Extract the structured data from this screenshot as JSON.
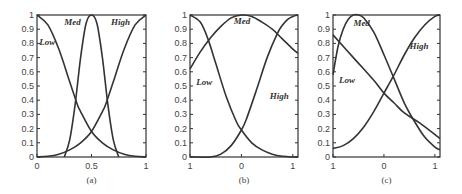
{
  "chart_data": [
    {
      "type": "line",
      "caption": "(a)",
      "xlim": [
        0,
        1
      ],
      "ylim": [
        0,
        1
      ],
      "xticks": [
        0,
        0.5,
        1
      ],
      "xtick_labels": [
        "0",
        "0.5",
        "1"
      ],
      "yticks": [
        0,
        0.1,
        0.2,
        0.3,
        0.4,
        0.5,
        0.6,
        0.7,
        0.8,
        0.9,
        1
      ],
      "ytick_labels": [
        "0",
        "0.1",
        "0.2",
        "0.3",
        "0.4",
        "0.5",
        "0.6",
        "0.7",
        "0.8",
        "0.9",
        "1"
      ],
      "series": [
        {
          "name": "Low",
          "label_pos": [
            0.02,
            0.79
          ],
          "x": [
            0,
            0.1,
            0.2,
            0.3,
            0.37,
            0.4,
            0.5,
            0.6,
            0.7,
            0.8,
            0.9,
            1
          ],
          "y": [
            1,
            0.93,
            0.76,
            0.53,
            0.37,
            0.32,
            0.18,
            0.1,
            0.05,
            0.02,
            0.005,
            0
          ]
        },
        {
          "name": "Med",
          "label_pos": [
            0.25,
            0.93
          ],
          "x": [
            0.25,
            0.3,
            0.35,
            0.4,
            0.45,
            0.5,
            0.55,
            0.6,
            0.65,
            0.7,
            0.75
          ],
          "y": [
            0,
            0.12,
            0.37,
            0.7,
            0.94,
            1,
            0.94,
            0.7,
            0.37,
            0.12,
            0
          ]
        },
        {
          "name": "High",
          "label_pos": [
            0.68,
            0.93
          ],
          "x": [
            0,
            0.1,
            0.2,
            0.3,
            0.4,
            0.5,
            0.6,
            0.63,
            0.7,
            0.8,
            0.9,
            1
          ],
          "y": [
            0,
            0.005,
            0.02,
            0.05,
            0.1,
            0.18,
            0.32,
            0.37,
            0.53,
            0.76,
            0.93,
            1
          ]
        }
      ]
    },
    {
      "type": "line",
      "caption": "(b)",
      "xlim": [
        -1,
        1.1
      ],
      "ylim": [
        0,
        1
      ],
      "xticks": [
        -1,
        0,
        1
      ],
      "xtick_labels": [
        "1",
        "0",
        "1"
      ],
      "yticks": [
        0,
        0.1,
        0.2,
        0.3,
        0.4,
        0.5,
        0.6,
        0.7,
        0.8,
        0.9,
        1
      ],
      "ytick_labels": [
        "0",
        "0.1",
        "0.2",
        "0.3",
        "0.4",
        "0.5",
        "0.6",
        "0.7",
        "0.8",
        "0.9",
        "1"
      ],
      "series": [
        {
          "name": "Low",
          "label_pos": [
            -0.88,
            0.51
          ],
          "x": [
            -1,
            -0.8,
            -0.65,
            -0.5,
            -0.3,
            -0.1,
            0,
            0.2,
            0.4,
            0.6,
            0.8,
            1,
            1.1
          ],
          "y": [
            1,
            0.95,
            0.83,
            0.66,
            0.43,
            0.25,
            0.19,
            0.1,
            0.05,
            0.02,
            0.005,
            0,
            0
          ]
        },
        {
          "name": "Med",
          "label_pos": [
            -0.15,
            0.94
          ],
          "x": [
            -1,
            -0.8,
            -0.6,
            -0.4,
            -0.2,
            0,
            0.2,
            0.4,
            0.6,
            0.8,
            1,
            1.1
          ],
          "y": [
            0.62,
            0.74,
            0.84,
            0.92,
            0.98,
            1,
            0.99,
            0.95,
            0.9,
            0.83,
            0.76,
            0.73
          ]
        },
        {
          "name": "High",
          "label_pos": [
            0.55,
            0.41
          ],
          "x": [
            -1,
            -0.6,
            -0.4,
            -0.2,
            0,
            0.1,
            0.3,
            0.5,
            0.7,
            0.8,
            0.9,
            1,
            1.1
          ],
          "y": [
            0,
            0,
            0.02,
            0.08,
            0.19,
            0.27,
            0.48,
            0.7,
            0.87,
            0.93,
            0.97,
            0.99,
            1
          ]
        }
      ]
    },
    {
      "type": "line",
      "caption": "(c)",
      "xlim": [
        -1,
        1.1
      ],
      "ylim": [
        0,
        1
      ],
      "xticks": [
        -1,
        0,
        1
      ],
      "xtick_labels": [
        "1",
        "0",
        "1"
      ],
      "yticks": [
        0,
        0.1,
        0.2,
        0.3,
        0.4,
        0.5,
        0.6,
        0.7,
        0.8,
        0.9,
        1
      ],
      "ytick_labels": [
        "0",
        "0.1",
        "0.2",
        "0.3",
        "0.4",
        "0.5",
        "0.6",
        "0.7",
        "0.8",
        "0.9",
        "1"
      ],
      "series": [
        {
          "name": "Low",
          "label_pos": [
            -0.88,
            0.52
          ],
          "x": [
            -1,
            -0.6,
            -0.2,
            0,
            0.2,
            0.4,
            0.7,
            1.1
          ],
          "y": [
            0.86,
            0.7,
            0.54,
            0.45,
            0.38,
            0.31,
            0.24,
            0.13
          ]
        },
        {
          "name": "Med",
          "label_pos": [
            -0.6,
            0.92
          ],
          "x": [
            -1,
            -0.9,
            -0.8,
            -0.7,
            -0.6,
            -0.5,
            -0.4,
            -0.2,
            0,
            0.2,
            0.4,
            0.6,
            0.8,
            1,
            1.1
          ],
          "y": [
            0.58,
            0.78,
            0.9,
            0.97,
            1,
            1,
            0.98,
            0.88,
            0.72,
            0.55,
            0.38,
            0.25,
            0.14,
            0.07,
            0.05
          ]
        },
        {
          "name": "High",
          "label_pos": [
            0.5,
            0.76
          ],
          "x": [
            -1,
            -0.8,
            -0.6,
            -0.4,
            -0.2,
            0,
            0.2,
            0.4,
            0.6,
            0.8,
            1,
            1.1
          ],
          "y": [
            0.06,
            0.08,
            0.13,
            0.21,
            0.32,
            0.45,
            0.58,
            0.72,
            0.84,
            0.93,
            0.99,
            1
          ]
        }
      ]
    }
  ]
}
